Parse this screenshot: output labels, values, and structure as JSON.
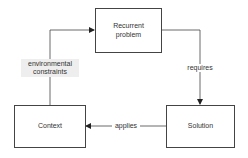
{
  "diagram": {
    "nodes": {
      "recurrent_problem": {
        "line1": "Recurrent",
        "line2": "problem"
      },
      "context": {
        "label": "Context"
      },
      "solution": {
        "label": "Solution"
      }
    },
    "edges": {
      "requires": "requires",
      "applies": "applies",
      "environmental_constraints": {
        "line1": "environmental",
        "line2": "constraints"
      }
    },
    "colors": {
      "stroke": "#444444",
      "label_bg": "#eeeeee"
    }
  }
}
